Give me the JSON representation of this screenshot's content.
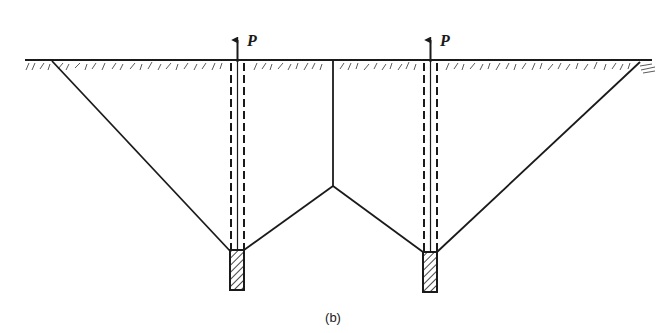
{
  "figure": {
    "caption": "(b)",
    "colors": {
      "line": "#1a1a1a",
      "background": "#ffffff"
    }
  },
  "loads": [
    {
      "label": "P",
      "direction": "up",
      "position": "left-pile"
    },
    {
      "label": "P",
      "direction": "up",
      "position": "right-pile"
    }
  ],
  "piles": [
    {
      "name": "left-pile",
      "anchor_block": "hatched"
    },
    {
      "name": "right-pile",
      "anchor_block": "hatched"
    }
  ],
  "ground": {
    "symbol": "soil-hatching"
  }
}
